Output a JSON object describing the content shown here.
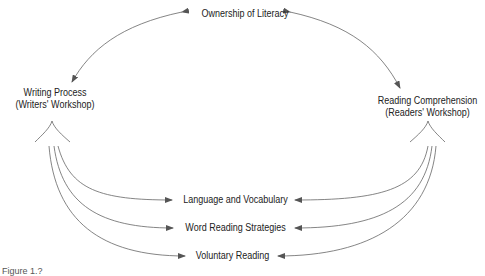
{
  "diagram": {
    "nodes": {
      "ownership": "Ownership of Literacy",
      "writing_line1": "Writing Process",
      "writing_line2": "(Writers' Workshop)",
      "reading_line1": "Reading Comprehension",
      "reading_line2": "(Readers' Workshop)",
      "language": "Language and Vocabulary",
      "word": "Word Reading Strategies",
      "voluntary": "Voluntary Reading"
    },
    "caption": "Figure 1.?",
    "colors": {
      "line": "#555555",
      "text": "#222222"
    }
  }
}
